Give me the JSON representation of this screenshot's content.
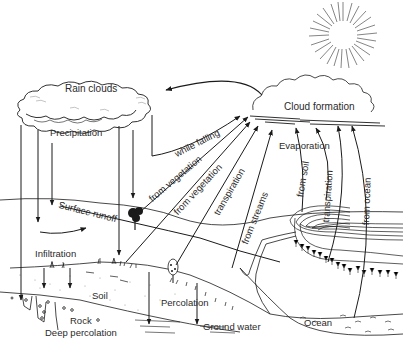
{
  "diagram": {
    "type": "water-cycle",
    "ink_color": "#1a1a1a",
    "background": "#ffffff",
    "labels": {
      "rain_clouds": "Rain clouds",
      "cloud_formation": "Cloud formation",
      "precipitation": "Precipitation",
      "while_falling": "while falling",
      "from_vegetation_1": "from vegetation",
      "from_vegetation_2": "from vegetation",
      "transpiration_1": "transpiration",
      "from_streams": "from streams",
      "evaporation": "Evaporation",
      "from_soil": "from soil",
      "transpiration_2": "transpiration",
      "from_ocean": "from ocean",
      "surface_runoff": "Surface runoff",
      "infiltration": "Infiltration",
      "soil": "Soil",
      "rock": "Rock",
      "deep_percolation": "Deep percolation",
      "percolation": "Percolation",
      "ground_water": "Ground water",
      "ocean": "Ocean"
    },
    "elements": [
      {
        "id": "sun",
        "kind": "sun-icon"
      },
      {
        "id": "rain-clouds",
        "kind": "cloud"
      },
      {
        "id": "cloud-formation",
        "kind": "cloud"
      },
      {
        "id": "tree-1",
        "kind": "tree-icon"
      },
      {
        "id": "tree-2",
        "kind": "tree-icon"
      },
      {
        "id": "stream",
        "kind": "river"
      },
      {
        "id": "ocean",
        "kind": "water-body"
      }
    ],
    "flows": [
      {
        "from": "rain-clouds",
        "to": "ground",
        "label": "Precipitation"
      },
      {
        "from": "cloud-formation",
        "to": "rain-clouds",
        "label": ""
      },
      {
        "from": "precipitation",
        "to": "cloud-formation",
        "label": "while falling"
      },
      {
        "from": "vegetation",
        "to": "cloud-formation",
        "label": "from vegetation"
      },
      {
        "from": "vegetation",
        "to": "cloud-formation",
        "label": "from vegetation"
      },
      {
        "from": "plants",
        "to": "cloud-formation",
        "label": "transpiration"
      },
      {
        "from": "streams",
        "to": "cloud-formation",
        "label": "from streams"
      },
      {
        "from": "soil",
        "to": "cloud-formation",
        "label": "from soil"
      },
      {
        "from": "plants",
        "to": "cloud-formation",
        "label": "transpiration"
      },
      {
        "from": "ocean",
        "to": "cloud-formation",
        "label": "from ocean"
      },
      {
        "from": "surface",
        "to": "stream",
        "label": "Surface runoff"
      },
      {
        "from": "surface",
        "to": "soil",
        "label": "Infiltration"
      },
      {
        "from": "soil",
        "to": "ground-water",
        "label": "Percolation"
      },
      {
        "from": "rock",
        "to": "deep",
        "label": "Deep percolation"
      }
    ]
  }
}
